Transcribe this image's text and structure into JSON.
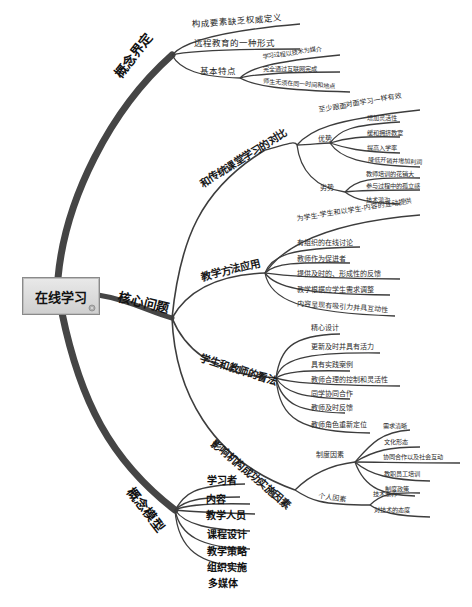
{
  "root": {
    "label": "在线学习"
  },
  "branches": {
    "definition": {
      "label": "概念界定",
      "children": [
        {
          "label": "构成要素缺乏权威定义"
        },
        {
          "label": "远程教育的一种形式"
        },
        {
          "label": "基本特点",
          "children": [
            {
              "label": "学习过程以技术为媒介"
            },
            {
              "label": "完全通过互联网完成"
            },
            {
              "label": "师生无须在同一时间和地点"
            }
          ]
        }
      ]
    },
    "core": {
      "label": "核心问题",
      "children": {
        "compare": {
          "label": "和传统课堂学习的对比",
          "children": [
            {
              "label": "至少跟面对面学习一样有效"
            },
            {
              "label": "优势",
              "children": [
                {
                  "label": "增加灵活性"
                },
                {
                  "label": "缓和拥挤教室"
                },
                {
                  "label": "提高入学率"
                },
                {
                  "label": "降低开销并增加利润"
                }
              ]
            },
            {
              "label": "劣势",
              "children": [
                {
                  "label": "教师培训的花销大"
                },
                {
                  "label": "参与过程中的孤立感"
                },
                {
                  "label": "技术鸿沟"
                }
              ]
            }
          ]
        },
        "methods": {
          "label": "教学方法应用",
          "children": [
            {
              "label": "为学生-学生和以学生-内容的互动提供"
            },
            {
              "label": "有组织的在线讨论"
            },
            {
              "label": "教师作为促进者"
            },
            {
              "label": "提供及时的、形成性的反馈"
            },
            {
              "label": "教学根据应学生需求调整"
            },
            {
              "label": "内容呈现有吸引力并具互动性"
            }
          ]
        },
        "views": {
          "label": "学生和教师的看法",
          "children": [
            {
              "label": "精心设计"
            },
            {
              "label": "更新及时并具有活力"
            },
            {
              "label": "具有实践案例"
            },
            {
              "label": "教师合理的控制和灵活性"
            },
            {
              "label": "同学协同合作"
            },
            {
              "label": "教师及时反馈"
            },
            {
              "label": "教师角色重新定位"
            }
          ]
        },
        "factors": {
          "label": "影响机构成功实施因素",
          "children": [
            {
              "label": "制度因素",
              "children": [
                {
                  "label": "需求清晰"
                },
                {
                  "label": "文化形态"
                },
                {
                  "label": "协同合作以及社会互动"
                },
                {
                  "label": "教职员工培训"
                },
                {
                  "label": "制度政策"
                }
              ]
            },
            {
              "label": "个人因素",
              "children": [
                {
                  "label": "技术素养"
                },
                {
                  "label": "对技术的态度"
                }
              ]
            }
          ]
        }
      }
    },
    "model": {
      "label": "概念模型",
      "children": [
        {
          "label": "学习者"
        },
        {
          "label": "内容"
        },
        {
          "label": "教学人员"
        },
        {
          "label": "课程设计"
        },
        {
          "label": "教学策略"
        },
        {
          "label": "组织实施"
        },
        {
          "label": "多媒体"
        }
      ]
    }
  },
  "colors": {
    "trunk": "#4a4a4a",
    "branch": "#3a3a3a",
    "root_fill": "#dcdcdc"
  }
}
